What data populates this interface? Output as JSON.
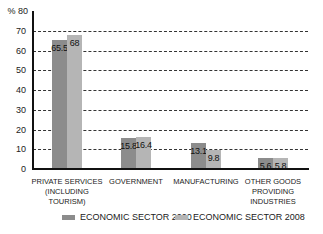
{
  "chart_data": {
    "type": "bar",
    "title": "",
    "xlabel": "",
    "ylabel": "%",
    "ylim": [
      0,
      80
    ],
    "yticks": [
      0,
      10,
      20,
      30,
      40,
      50,
      60,
      70,
      80
    ],
    "ytick_labels": [
      "0",
      "10",
      "20",
      "30",
      "40",
      "50",
      "60",
      "70",
      "% 80"
    ],
    "grid": "horizontal dashed",
    "legend_position": "bottom",
    "categories": [
      "PRIVATE SERVICES (INCLUDING TOURISM)",
      "GOVERNMENT",
      "MANUFACTURING",
      "OTHER GOODS PROVIDING INDUSTRIES"
    ],
    "category_lines": [
      [
        "PRIVATE SERVICES",
        "(INCLUDING",
        "TOURISM)"
      ],
      [
        "GOVERNMENT"
      ],
      [
        "MANUFACTURING"
      ],
      [
        "OTHER GOODS",
        "PROVIDING",
        "INDUSTRIES"
      ]
    ],
    "series": [
      {
        "name": "ECONOMIC SECTOR 2000",
        "color": "#8c8c8c",
        "values": [
          65.5,
          15.8,
          13.1,
          5.6
        ],
        "labels": [
          "65.5",
          "15.8",
          "13.1",
          "5.6"
        ]
      },
      {
        "name": "ECONOMIC SECTOR 2008",
        "color": "#b5b5b5",
        "values": [
          68,
          16.4,
          9.8,
          5.8
        ],
        "labels": [
          "68",
          "16.4",
          "9.8",
          "5.8"
        ]
      }
    ]
  }
}
